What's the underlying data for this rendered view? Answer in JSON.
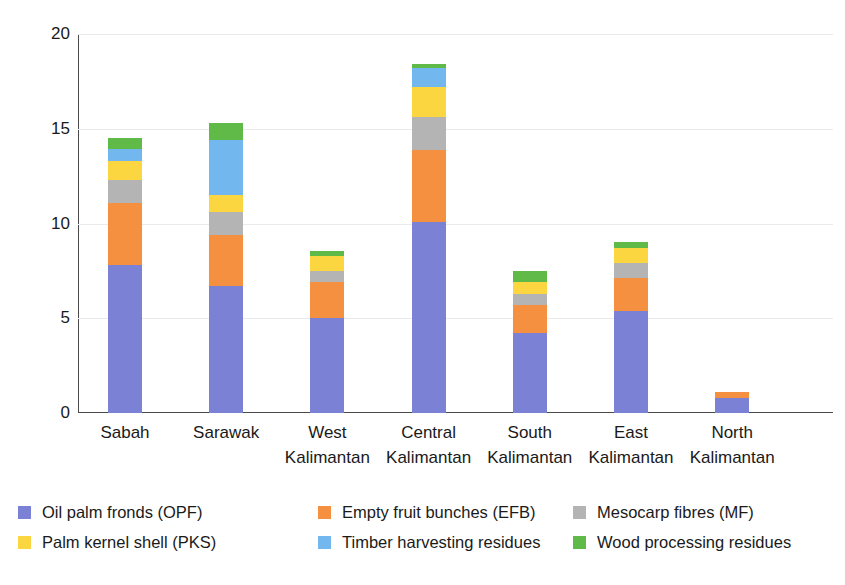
{
  "chart_data": {
    "type": "bar",
    "subtype": "stacked-bar",
    "title": "",
    "xlabel": "",
    "ylabel": "million dry tonne",
    "ylim": [
      0,
      20
    ],
    "yticks": [
      0,
      5,
      10,
      15,
      20
    ],
    "ytick_labels": [
      "0",
      "5",
      "10",
      "15",
      "20"
    ],
    "grid": "horizontal",
    "legend_position": "bottom",
    "categories": [
      "Sabah",
      "Sarawak",
      "West Kalimantan",
      "Central Kalimantan",
      "South Kalimantan",
      "East Kalimantan",
      "North Kalimantan"
    ],
    "category_lines": [
      {
        "line1": "Sabah",
        "line2": ""
      },
      {
        "line1": "Sarawak",
        "line2": ""
      },
      {
        "line1": "West",
        "line2": "Kalimantan"
      },
      {
        "line1": "Central",
        "line2": "Kalimantan"
      },
      {
        "line1": "South",
        "line2": "Kalimantan"
      },
      {
        "line1": "East",
        "line2": "Kalimantan"
      },
      {
        "line1": "North",
        "line2": "Kalimantan"
      }
    ],
    "series": [
      {
        "name": "Oil palm fronds (OPF)",
        "color": "#7b82d6",
        "values": [
          7.8,
          6.7,
          5.0,
          10.1,
          4.2,
          5.4,
          0.8
        ]
      },
      {
        "name": "Empty fruit bunches (EFB)",
        "color": "#f59040",
        "values": [
          3.3,
          2.7,
          1.9,
          3.8,
          1.5,
          1.7,
          0.3
        ]
      },
      {
        "name": "Mesocarp fibres (MF)",
        "color": "#b4b4b4",
        "values": [
          1.2,
          1.2,
          0.6,
          1.7,
          0.6,
          0.8,
          0.0
        ]
      },
      {
        "name": "Palm kernel shell (PKS)",
        "color": "#fcd640",
        "values": [
          1.0,
          0.9,
          0.8,
          1.6,
          0.6,
          0.8,
          0.0
        ]
      },
      {
        "name": "Timber harvesting residues",
        "color": "#72b8ee",
        "values": [
          0.65,
          2.9,
          0.0,
          1.0,
          0.0,
          0.0,
          0.0
        ]
      },
      {
        "name": "Wood processing residues",
        "color": "#5fba47",
        "values": [
          0.55,
          0.9,
          0.25,
          0.2,
          0.6,
          0.35,
          0.0
        ]
      }
    ],
    "totals": [
      14.5,
      15.3,
      8.55,
      18.4,
      7.5,
      9.05,
      1.1
    ]
  },
  "legend": {
    "items": [
      {
        "label": "Oil palm fronds (OPF)",
        "color": "#7b82d6",
        "icon": "legend-swatch-opf"
      },
      {
        "label": "Empty fruit bunches (EFB)",
        "color": "#f59040",
        "icon": "legend-swatch-efb"
      },
      {
        "label": "Mesocarp fibres (MF)",
        "color": "#b4b4b4",
        "icon": "legend-swatch-mf"
      },
      {
        "label": "Palm kernel shell (PKS)",
        "color": "#fcd640",
        "icon": "legend-swatch-pks"
      },
      {
        "label": "Timber harvesting residues",
        "color": "#72b8ee",
        "icon": "legend-swatch-timber"
      },
      {
        "label": "Wood processing residues",
        "color": "#5fba47",
        "icon": "legend-swatch-wood"
      }
    ]
  }
}
